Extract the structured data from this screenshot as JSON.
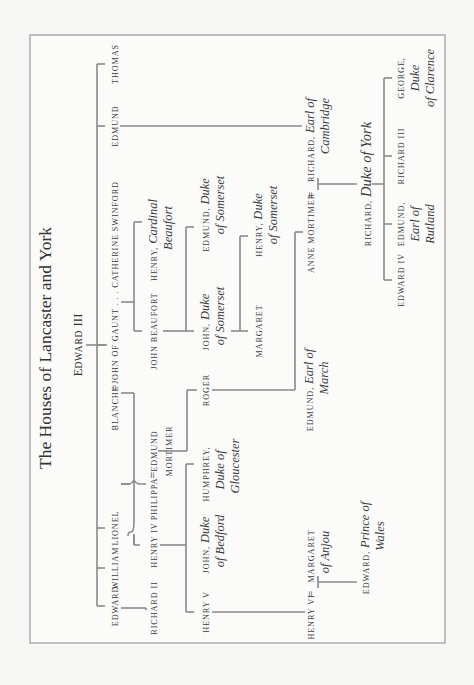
{
  "title": "The Houses of Lancaster and York",
  "root": {
    "initial": "E",
    "rest": "DWARD",
    "numeral": " III"
  },
  "gen1": {
    "edward": "EDWARD",
    "william": "WILLIAM",
    "lionel": "LIONEL",
    "blanche": "BLANCHE",
    "equals": "=",
    "john_of_gaunt": "JOHN OF GAUNT . . . CATHERINE SWINFORD",
    "edmund": "EDMUND",
    "thomas": "THOMAS"
  },
  "gen2": {
    "richard_ii": "RICHARD II",
    "henry_iv": "HENRY IV",
    "philippa": "PHILIPPA",
    "edmund_mortimer_1": "EDMUND",
    "edmund_mortimer_2": "MORTIMER",
    "john_beaufort": "JOHN BEAUFORT",
    "henry_cardinal_sc": "HENRY,",
    "henry_cardinal_it1": "Cardinal",
    "henry_cardinal_it2": "Beaufort"
  },
  "gen3": {
    "henry_v": "HENRY V",
    "john_bedford_sc": "JOHN,",
    "john_bedford_it1": "Duke",
    "john_bedford_it2": "of Bedford",
    "humphrey_sc": "HUMPHREY,",
    "humphrey_it1": "Duke of",
    "humphrey_it2": "Gloucester",
    "roger": "ROGER",
    "john_somerset_sc": "JOHN,",
    "john_somerset_it1": "Duke",
    "john_somerset_it2": "of Somerset",
    "edmund_somerset_sc": "EDMUND,",
    "edmund_somerset_it1": "Duke",
    "edmund_somerset_it2": "of Somerset"
  },
  "gen4": {
    "edmund_march_sc": "EDMUND,",
    "edmund_march_it1": "Earl of",
    "edmund_march_it2": "March",
    "margaret_beaufort": "MARGARET",
    "henry_somerset_sc": "HENRY,",
    "henry_somerset_it1": "Duke",
    "henry_somerset_it2": "of Somerset"
  },
  "gen5": {
    "henry_vi": "HENRY VI",
    "margaret_anjou_sc": "MARGARET",
    "margaret_anjou_it": "of Anjou",
    "anne_mortimer": "ANNE MORTIMER",
    "richard_cambridge_sc": "RICHARD,",
    "richard_cambridge_it1": "Earl of",
    "richard_cambridge_it2": "Cambridge"
  },
  "gen6": {
    "edward_prince_sc": "EDWARD,",
    "edward_prince_it1": "Prince of",
    "edward_prince_it2": "Wales",
    "richard_york_sc": "RICHARD,",
    "richard_york_it": "Duke of York"
  },
  "gen7": {
    "edward_iv": "EDWARD IV",
    "edmund_rutland_sc": "EDMUND,",
    "edmund_rutland_it1": "Earl of",
    "edmund_rutland_it2": "Rutland",
    "richard_iii": "RICHARD III",
    "george_sc": "GEORGE,",
    "george_it1": "Duke",
    "george_it2": "of Clarence"
  }
}
